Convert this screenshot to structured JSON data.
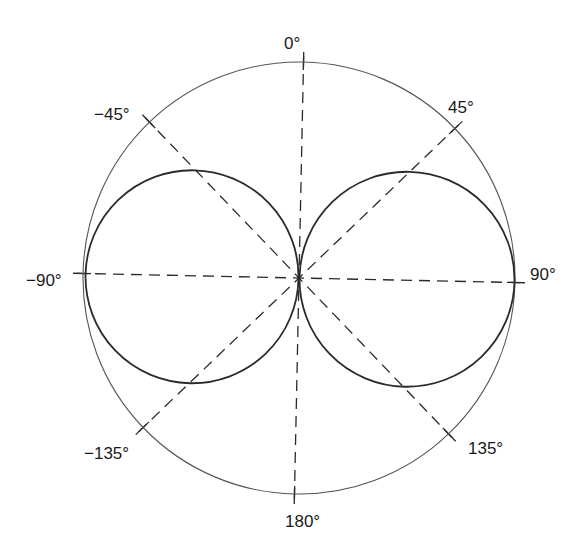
{
  "diagram": {
    "type": "polar-radiation-pattern",
    "center": [
      299,
      278
    ],
    "outer_radius": 216,
    "rotation_deg": 1.2,
    "lobes": [
      {
        "name": "left-lobe",
        "cx": -107,
        "cy": 1,
        "r": 106
      },
      {
        "name": "right-lobe",
        "cx": 108,
        "cy": -1,
        "r": 107
      }
    ],
    "angle_labels": [
      {
        "text": "0°",
        "angle": 0
      },
      {
        "text": "45°",
        "angle": 45
      },
      {
        "text": "90°",
        "angle": 90
      },
      {
        "text": "135°",
        "angle": 135
      },
      {
        "text": "180°",
        "angle": 180
      },
      {
        "text": "−135°",
        "angle": -135
      },
      {
        "text": "−90°",
        "angle": -90
      },
      {
        "text": "−45°",
        "angle": -45
      }
    ],
    "colors": {
      "line": "#2a2a2a",
      "outer_circle": "#555555",
      "background": "#ffffff"
    }
  }
}
